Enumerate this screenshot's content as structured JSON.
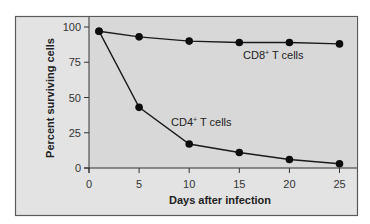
{
  "chart_data": {
    "type": "line",
    "title": "",
    "xlabel": "Days after infection",
    "ylabel": "Percent surviving cells",
    "xlim": [
      0,
      25
    ],
    "ylim": [
      0,
      100
    ],
    "xticks": [
      0,
      5,
      10,
      15,
      20,
      25
    ],
    "yticks": [
      0,
      25,
      50,
      75,
      100
    ],
    "grid": false,
    "legend": "inline labels",
    "x": [
      1,
      5,
      10,
      15,
      20,
      25
    ],
    "series": [
      {
        "name": "CD8+ T cells",
        "label_main": "CD8",
        "label_sup": "+",
        "label_rest": " T cells",
        "values": [
          97,
          93,
          90,
          89,
          89,
          88
        ]
      },
      {
        "name": "CD4+ T cells",
        "label_main": "CD4",
        "label_sup": "+",
        "label_rest": " T cells",
        "values": [
          97,
          43,
          17,
          11,
          6,
          3
        ]
      }
    ]
  },
  "colors": {
    "frame_bg": "#e3e3e3",
    "plot_bg": "#d8d8d8",
    "frame_border": "#5a5a5a",
    "line": "#1a1a1a",
    "marker": "#0d0d0d"
  }
}
